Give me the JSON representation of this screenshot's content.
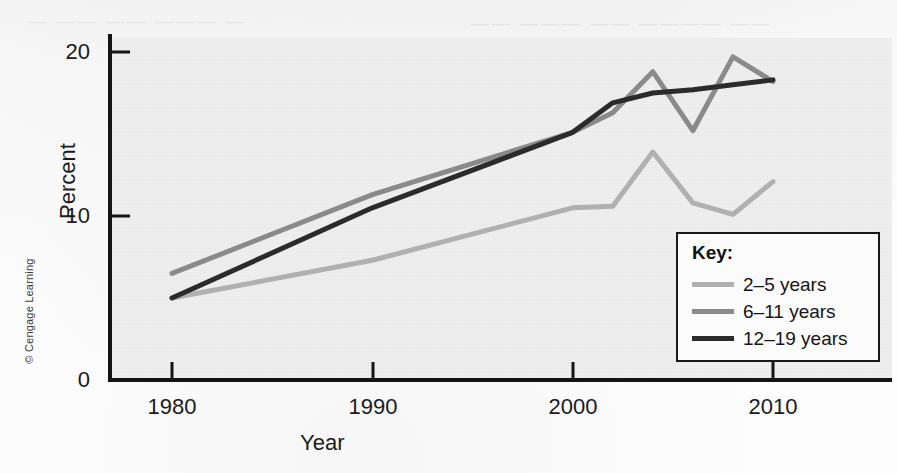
{
  "figure": {
    "credit": "© Cengage Learning",
    "ghost_line_1": "— —— —— ——— —",
    "ghost_line_2": "—— ——— —— ———— ——"
  },
  "legend": {
    "title": "Key:",
    "items": [
      {
        "label": "2–5 years",
        "color": "#b0b0b0"
      },
      {
        "label": "6–11 years",
        "color": "#8a8a8a"
      },
      {
        "label": "12–19 years",
        "color": "#2b2b2b"
      }
    ]
  },
  "chart_data": {
    "type": "line",
    "title": "",
    "xlabel": "Year",
    "ylabel": "Percent",
    "xlim": [
      1976,
      2013
    ],
    "ylim": [
      0,
      21
    ],
    "xticks": [
      1980,
      1990,
      2000,
      2010
    ],
    "yticks": [
      0,
      10,
      20
    ],
    "xtick_labels": [
      "1980",
      "1990",
      "2000",
      "2010"
    ],
    "ytick_labels": [
      "0",
      "10",
      "20"
    ],
    "grid": false,
    "legend_position": "lower-right",
    "series": [
      {
        "name": "2–5 years",
        "color": "#b0b0b0",
        "x": [
          1980,
          1990,
          2000,
          2002,
          2004,
          2006,
          2008,
          2010
        ],
        "values": [
          5.0,
          7.3,
          10.5,
          10.6,
          13.9,
          10.8,
          10.1,
          12.1
        ]
      },
      {
        "name": "6–11 years",
        "color": "#8a8a8a",
        "x": [
          1980,
          1990,
          2000,
          2002,
          2004,
          2006,
          2008,
          2010
        ],
        "values": [
          6.5,
          11.3,
          15.1,
          16.3,
          18.8,
          15.2,
          19.7,
          18.2
        ]
      },
      {
        "name": "12–19 years",
        "color": "#2b2b2b",
        "x": [
          1980,
          1990,
          2000,
          2002,
          2004,
          2006,
          2008,
          2010
        ],
        "values": [
          5.0,
          10.5,
          15.1,
          16.9,
          17.5,
          17.7,
          18.0,
          18.3
        ]
      }
    ]
  }
}
